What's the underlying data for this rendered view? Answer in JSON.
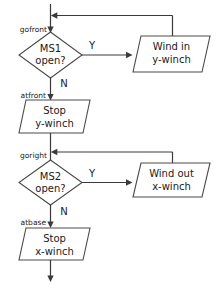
{
  "diagram": {
    "colors": {
      "background": "#ffffff",
      "shape_stroke": "#4a4a4a",
      "connector": "#3a3a3a",
      "text": "#1a1a1a"
    },
    "point_labels": [
      {
        "id": "gofront",
        "text": "gofront"
      },
      {
        "id": "atfront",
        "text": "atfront"
      },
      {
        "id": "goright",
        "text": "goright"
      },
      {
        "id": "atbase",
        "text": "atbase"
      }
    ],
    "decisions": [
      {
        "id": "ms1",
        "line1": "MS1",
        "line2": "open?"
      },
      {
        "id": "ms2",
        "line1": "MS2",
        "line2": "open?"
      }
    ],
    "processes": [
      {
        "id": "wind-in-y",
        "line1": "Wind in",
        "line2": "y-winch"
      },
      {
        "id": "stop-y",
        "line1": "Stop",
        "line2": "y-winch"
      },
      {
        "id": "wind-out-x",
        "line1": "Wind out",
        "line2": "x-winch"
      },
      {
        "id": "stop-x",
        "line1": "Stop",
        "line2": "x-winch"
      }
    ],
    "edge_labels": [
      {
        "id": "ms1-yes",
        "text": "Y"
      },
      {
        "id": "ms1-no",
        "text": "N"
      },
      {
        "id": "ms2-yes",
        "text": "Y"
      },
      {
        "id": "ms2-no",
        "text": "N"
      }
    ]
  }
}
